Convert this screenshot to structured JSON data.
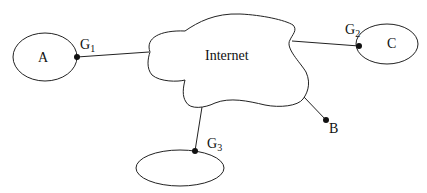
{
  "diagram": {
    "type": "network-topology",
    "cloud": {
      "label": "Internet"
    },
    "nodes": [
      {
        "id": "A",
        "label": "A",
        "shape": "ellipse"
      },
      {
        "id": "C",
        "label": "C",
        "shape": "ellipse"
      },
      {
        "id": "N3",
        "label": "",
        "shape": "ellipse"
      },
      {
        "id": "B",
        "label": "B",
        "shape": "point"
      }
    ],
    "gateways": [
      {
        "id": "G1",
        "base": "G",
        "sub": "1",
        "connects": [
          "A",
          "Internet"
        ]
      },
      {
        "id": "G2",
        "base": "G",
        "sub": "2",
        "connects": [
          "C",
          "Internet"
        ]
      },
      {
        "id": "G3",
        "base": "G",
        "sub": "3",
        "connects": [
          "N3",
          "Internet"
        ]
      }
    ],
    "edges": [
      {
        "from": "G1",
        "to": "Internet"
      },
      {
        "from": "G2",
        "to": "Internet"
      },
      {
        "from": "G3",
        "to": "Internet"
      },
      {
        "from": "B",
        "to": "Internet"
      }
    ],
    "colors": {
      "stroke": "#222222",
      "background": "#ffffff"
    }
  }
}
